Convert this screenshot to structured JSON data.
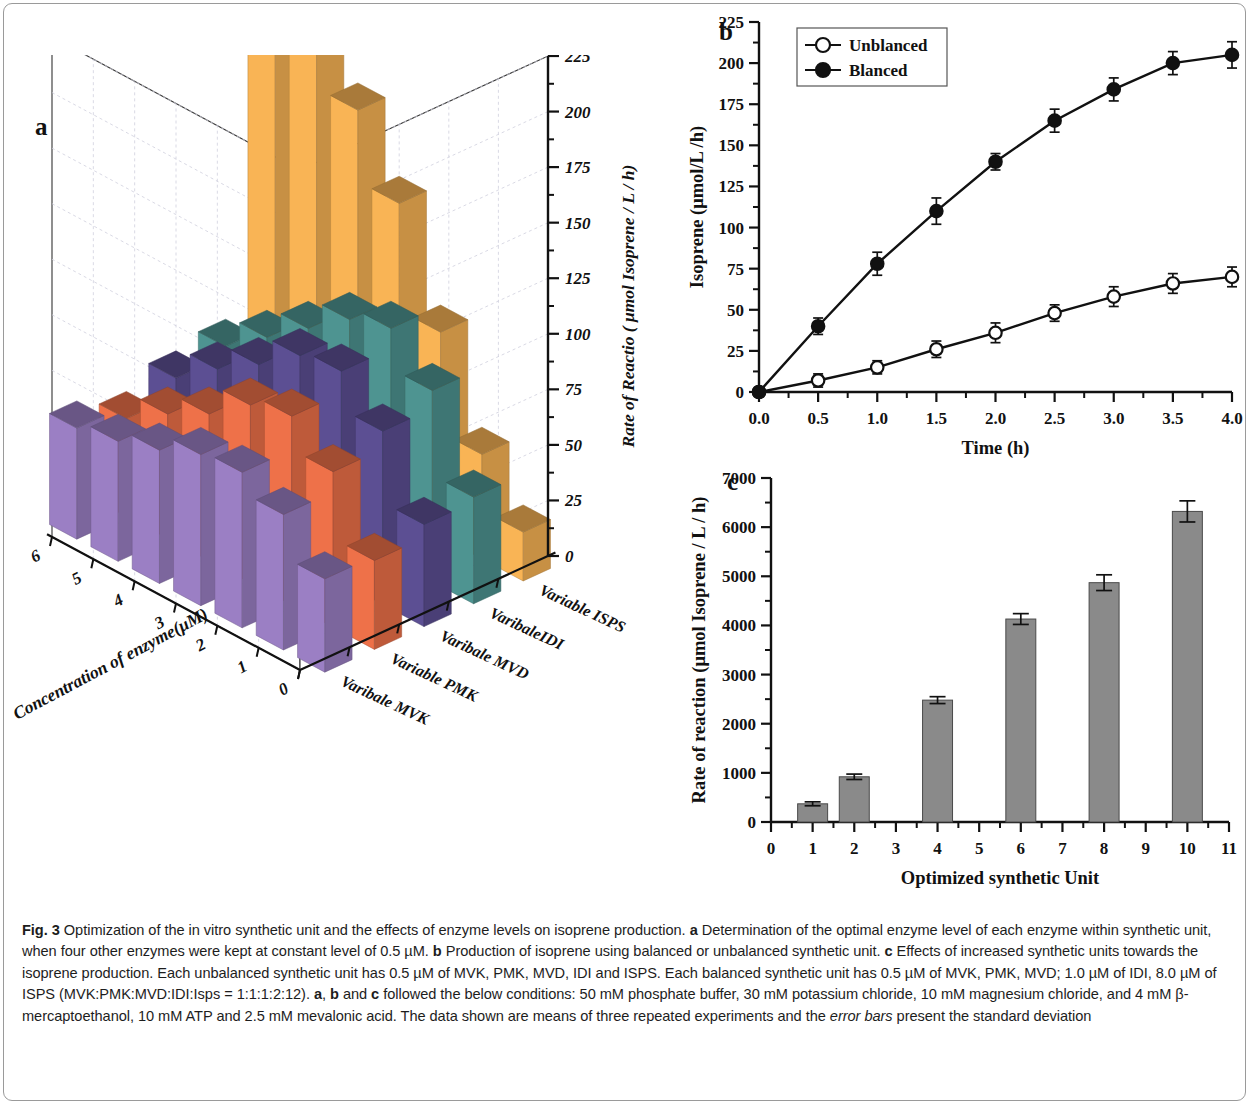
{
  "figure": {
    "label": "Fig. 3",
    "caption_parts": [
      {
        "t": "Fig. 3",
        "b": true
      },
      {
        "t": "  Optimization of the in vitro synthetic unit and the effects of enzyme levels on isoprene production. "
      },
      {
        "t": "a",
        "b": true
      },
      {
        "t": " Determination of the optimal enzyme level of each enzyme within synthetic unit, when four other enzymes were kept at constant level of 0.5 µM. "
      },
      {
        "t": "b",
        "b": true
      },
      {
        "t": " Production of isoprene using balanced or unbalanced synthetic unit. "
      },
      {
        "t": "c",
        "b": true
      },
      {
        "t": " Effects of increased synthetic units towards the isoprene production. Each unbalanced synthetic unit has 0.5 µM of MVK, PMK, MVD, IDI and ISPS. Each balanced synthetic unit has 0.5 µM of MVK, PMK, MVD; 1.0 µM of IDI, 8.0 µM of ISPS (MVK:PMK:MVD:IDI:Isps = 1:1:1:2:12). "
      },
      {
        "t": "a",
        "b": true
      },
      {
        "t": ", "
      },
      {
        "t": "b",
        "b": true
      },
      {
        "t": " and "
      },
      {
        "t": "c",
        "b": true
      },
      {
        "t": " followed the below conditions: 50 mM phosphate buffer, 30 mM potassium chloride, 10 mM magnesium chloride, and 4 mM β-mercaptoethanol, 10 mM ATP and 2.5 mM mevalonic acid. The data shown are means of three repeated experiments and the "
      },
      {
        "t": "error bars",
        "i": true
      },
      {
        "t": " present the standard deviation"
      }
    ]
  },
  "colors": {
    "series_mvk": "#9B7FC4",
    "series_pmk": "#EE7149",
    "series_mvd": "#5C4F93",
    "series_idi": "#4E9491",
    "series_isps": "#F9B455",
    "bar_gray": "#8A8A8A",
    "axis": "#111111",
    "grid": "#cfcfdd"
  },
  "panel_a": {
    "letter": "a",
    "chart_data": {
      "type": "bar",
      "subtype": "3d-bar",
      "title": "",
      "xlabel": "Concentration of enzyme(μM)",
      "ylabel": "",
      "zlabel": "Rate of Reactio ( μmol Isoprene / L / h)",
      "xticks": [
        "0",
        "1",
        "2",
        "3",
        "4",
        "5",
        "6"
      ],
      "xlim": [
        0,
        6
      ],
      "zlim": [
        0,
        225
      ],
      "zticks": [
        "0",
        "25",
        "50",
        "75",
        "100",
        "125",
        "150",
        "175",
        "200",
        "225"
      ],
      "categories": [
        "Varibale MVK",
        "Variable PMK",
        "Varibale MVD",
        "VaribaleIDI",
        "Variable ISPS"
      ],
      "x": [
        0.5,
        1.0,
        2.0,
        3.0,
        4.0,
        5.0,
        6.0
      ],
      "series": [
        {
          "name": "Varibale MVK",
          "color": "#9B7FC4",
          "values": [
            42,
            61,
            70,
            68,
            60,
            54,
            50
          ]
        },
        {
          "name": "Variable PMK",
          "color": "#EE7149",
          "values": [
            40,
            70,
            85,
            80,
            66,
            56,
            44
          ]
        },
        {
          "name": "Varibale MVD",
          "color": "#5C4F93",
          "values": [
            46,
            78,
            95,
            92,
            78,
            66,
            52
          ]
        },
        {
          "name": "VaribaleIDI",
          "color": "#4E9491",
          "values": [
            48,
            86,
            104,
            98,
            84,
            70,
            56
          ]
        },
        {
          "name": "Variable ISPS",
          "color": "#F9B455",
          "values": [
            22,
            47,
            92,
            140,
            172,
            196,
            210
          ]
        }
      ]
    }
  },
  "panel_b": {
    "letter": "b",
    "legend": [
      {
        "label": "Unblanced",
        "marker": "open-circle"
      },
      {
        "label": "Blanced",
        "marker": "filled-circle"
      }
    ],
    "chart_data": {
      "type": "line",
      "title": "",
      "xlabel": "Time (h)",
      "ylabel": "Isoprene (μmol/L /h)",
      "xlim": [
        0.0,
        4.0
      ],
      "ylim": [
        0,
        225
      ],
      "xticks": [
        "0.0",
        "0.5",
        "1.0",
        "1.5",
        "2.0",
        "2.5",
        "3.0",
        "3.5",
        "4.0"
      ],
      "yticks": [
        "0",
        "25",
        "50",
        "75",
        "100",
        "125",
        "150",
        "175",
        "200",
        "225"
      ],
      "grid": false,
      "legend_position": "top-left",
      "x": [
        0.0,
        0.5,
        1.0,
        1.5,
        2.0,
        2.5,
        3.0,
        3.5,
        4.0
      ],
      "series": [
        {
          "name": "Unblanced",
          "marker": "open-circle",
          "values": [
            0,
            7,
            15,
            26,
            36,
            48,
            58,
            66,
            70
          ],
          "errors": [
            0,
            4,
            4,
            5,
            6,
            5,
            6,
            6,
            6
          ]
        },
        {
          "name": "Blanced",
          "marker": "filled-circle",
          "values": [
            0,
            40,
            78,
            110,
            140,
            165,
            184,
            200,
            205
          ],
          "errors": [
            0,
            5,
            7,
            8,
            5,
            7,
            7,
            7,
            8
          ]
        }
      ]
    }
  },
  "panel_c": {
    "letter": "c",
    "chart_data": {
      "type": "bar",
      "title": "",
      "xlabel": "Optimized synthetic Unit",
      "ylabel": "Rate of reaction (μmol Isoprene / L / h)",
      "xlim": [
        0,
        11
      ],
      "ylim": [
        0,
        7000
      ],
      "xticks": [
        "0",
        "1",
        "2",
        "3",
        "4",
        "5",
        "6",
        "7",
        "8",
        "9",
        "10",
        "11"
      ],
      "yticks": [
        "0",
        "1000",
        "2000",
        "3000",
        "4000",
        "5000",
        "6000",
        "7000"
      ],
      "grid": false,
      "categories": [
        1,
        2,
        4,
        6,
        8,
        10
      ],
      "values": [
        370,
        920,
        2480,
        4130,
        4870,
        6320
      ],
      "errors": [
        40,
        55,
        70,
        110,
        160,
        215
      ]
    }
  }
}
